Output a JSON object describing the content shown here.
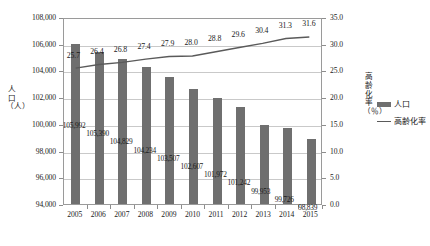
{
  "chart_data": {
    "type": "bar",
    "title": "",
    "categories": [
      "2005",
      "2006",
      "2007",
      "2008",
      "2009",
      "2010",
      "2011",
      "2012",
      "2013",
      "2014",
      "2015"
    ],
    "series": [
      {
        "name": "人口",
        "type": "bar",
        "axis": "left",
        "color": "#6f6f6f",
        "values": [
          105992,
          105390,
          104829,
          104234,
          103507,
          102607,
          101972,
          101242,
          99953,
          99726,
          98839
        ],
        "labels": [
          "105,992",
          "105,390",
          "104,829",
          "104,234",
          "103,507",
          "102,607",
          "101,972",
          "101,242",
          "99,953",
          "99,726",
          "98,839"
        ]
      },
      {
        "name": "高齢化率",
        "type": "line",
        "axis": "right",
        "color": "#5a5a5a",
        "values": [
          25.7,
          26.4,
          26.8,
          27.4,
          27.9,
          28.0,
          28.8,
          29.6,
          30.4,
          31.3,
          31.6
        ],
        "labels": [
          "25.7",
          "26.4",
          "26.8",
          "27.4",
          "27.9",
          "28.0",
          "28.8",
          "29.6",
          "30.4",
          "31.3",
          "31.6"
        ]
      }
    ],
    "xlabel": "",
    "ylabel": "人口（人）",
    "y2label": "高齢化率（％）",
    "ylim": [
      94000,
      108000
    ],
    "y2lim": [
      0.0,
      35.0
    ],
    "yticks": [
      "94,000",
      "96,000",
      "98,000",
      "100,000",
      "102,000",
      "104,000",
      "106,000",
      "108,000"
    ],
    "ytick_values": [
      94000,
      96000,
      98000,
      100000,
      102000,
      104000,
      106000,
      108000
    ],
    "y2ticks": [
      "0.0",
      "5.0",
      "10.0",
      "15.0",
      "20.0",
      "25.0",
      "30.0",
      "35.0"
    ],
    "y2tick_values": [
      0,
      5,
      10,
      15,
      20,
      25,
      30,
      35
    ],
    "grid": true,
    "legend_position": "right",
    "legend": [
      "人口",
      "高齢化率"
    ]
  },
  "axis_titles": {
    "left_chars": [
      "人",
      "口",
      "（",
      "人",
      "）"
    ],
    "right_chars": [
      "高",
      "齢",
      "化",
      "率",
      "（",
      "％",
      "）"
    ]
  }
}
